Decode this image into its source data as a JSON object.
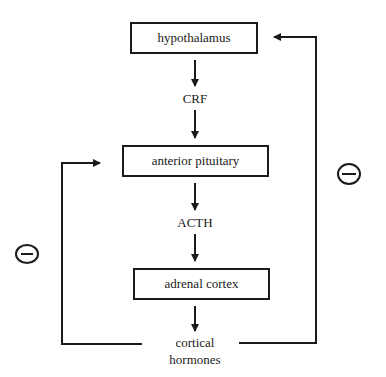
{
  "diagram": {
    "nodes": [
      {
        "id": "hypothalamus",
        "label": "hypothalamus",
        "boxed": true
      },
      {
        "id": "crf",
        "label": "CRF",
        "boxed": false
      },
      {
        "id": "anterior_pituitary",
        "label": "anterior pituitary",
        "boxed": true
      },
      {
        "id": "acth",
        "label": "ACTH",
        "boxed": false
      },
      {
        "id": "adrenal_cortex",
        "label": "adrenal cortex",
        "boxed": true
      },
      {
        "id": "cortical_hormones",
        "label_line1": "cortical",
        "label_line2": "hormones",
        "boxed": false
      }
    ],
    "edges": [
      {
        "from": "hypothalamus",
        "to": "crf"
      },
      {
        "from": "crf",
        "to": "anterior_pituitary"
      },
      {
        "from": "anterior_pituitary",
        "to": "acth"
      },
      {
        "from": "acth",
        "to": "adrenal_cortex"
      },
      {
        "from": "adrenal_cortex",
        "to": "cortical_hormones"
      },
      {
        "from": "cortical_hormones",
        "to": "hypothalamus",
        "type": "negative-feedback",
        "sign": "minus-circle-icon"
      },
      {
        "from": "cortical_hormones",
        "to": "anterior_pituitary",
        "type": "negative-feedback",
        "sign": "minus-circle-icon"
      }
    ],
    "line_color": "#1a1a1a"
  }
}
